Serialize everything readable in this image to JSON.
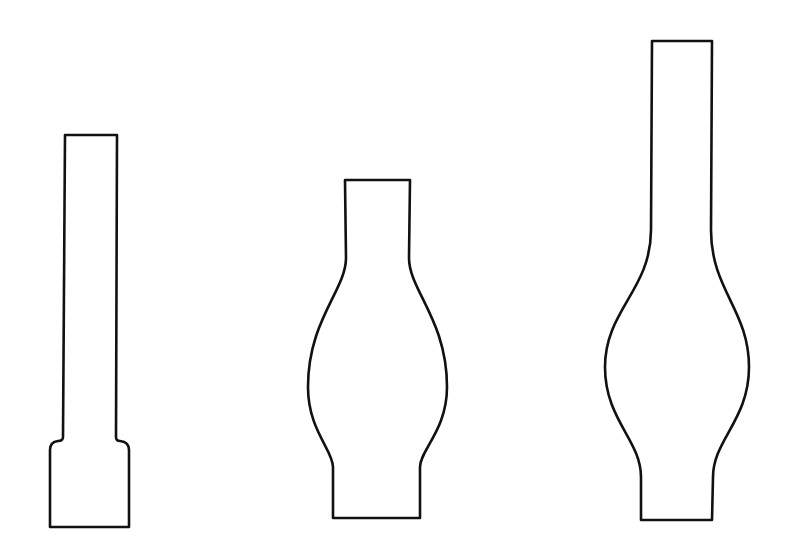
{
  "canvas": {
    "width": 792,
    "height": 555,
    "background": "#ffffff",
    "stroke": "#111111"
  },
  "figures": [
    {
      "name": "straight-chimney",
      "path": "M65 135 L117 135 L116 437 Q116 441 120 441 Q129 442 129 450 L129 527 L50 527 L50 450 Q50 442 58 441 Q63 441 63 437 Z"
    },
    {
      "name": "short-bulge-chimney",
      "path": "M345 180 L410 180 L409 258 C409 290 447 320 447 387 C447 430 420 450 420 467 L420 518 L333 518 L333 467 C333 450 308 430 308 387 C308 320 346 290 346 258 Z"
    },
    {
      "name": "tall-bulge-chimney",
      "path": "M652 41 L712 41 L711 230 C711 290 749 310 749 367 C749 420 713 440 713 477 L712 520 L641 520 L641 477 C641 440 605 420 605 367 C605 310 651 290 651 230 Z"
    }
  ]
}
